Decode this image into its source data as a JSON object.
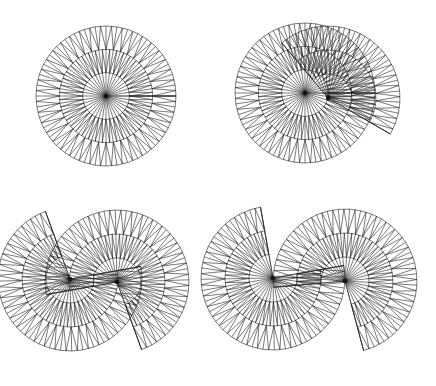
{
  "figure": {
    "stroke_color": "#222222",
    "background": "#ffffff",
    "panels": [
      {
        "id": "single-disk",
        "sheets": [
          {
            "cx": 106,
            "cy": 96,
            "r": 70,
            "rings": 3,
            "spokes": 40,
            "start": 0,
            "sweep": 360
          }
        ]
      },
      {
        "id": "two-center",
        "sheets": [
          {
            "cx": 305,
            "cy": 93,
            "r": 70,
            "rings": 3,
            "spokes": 40,
            "start": 0,
            "sweep": 360
          },
          {
            "cx": 328,
            "cy": 98,
            "r": 72,
            "rings": 3,
            "spokes": 40,
            "start": -30,
            "sweep": 160
          }
        ]
      },
      {
        "id": "two-center-wide",
        "sheets": [
          {
            "cx": 70,
            "cy": 279,
            "r": 72,
            "rings": 3,
            "spokes": 40,
            "start": 110,
            "sweep": 260
          },
          {
            "cx": 117,
            "cy": 282,
            "r": 72,
            "rings": 3,
            "spokes": 40,
            "start": -70,
            "sweep": 260
          }
        ]
      },
      {
        "id": "two-center-extended",
        "sheets": [
          {
            "cx": 273,
            "cy": 278,
            "r": 72,
            "rings": 3,
            "spokes": 40,
            "start": 100,
            "sweep": 270
          },
          {
            "cx": 345,
            "cy": 281,
            "r": 72,
            "rings": 3,
            "spokes": 40,
            "start": -75,
            "sweep": 260
          }
        ]
      }
    ]
  }
}
